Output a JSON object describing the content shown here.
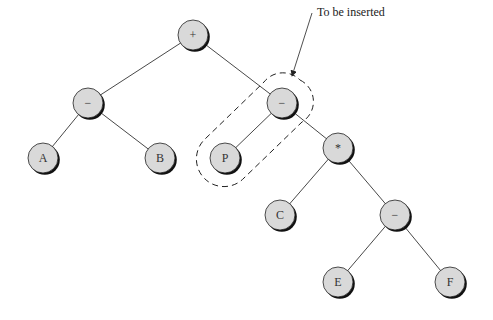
{
  "diagram": {
    "type": "expression-tree",
    "annotation": {
      "text": "To be inserted",
      "x": 315,
      "y": 14
    },
    "node_style": {
      "fill": "#d9d9d9",
      "stroke": "#222222",
      "shadow": "#111111",
      "radius": 15
    },
    "nodes": [
      {
        "id": "plus",
        "label": "+",
        "x": 193,
        "y": 35
      },
      {
        "id": "minus1",
        "label": "−",
        "x": 88,
        "y": 103
      },
      {
        "id": "minus2",
        "label": "−",
        "x": 282,
        "y": 103
      },
      {
        "id": "A",
        "label": "A",
        "x": 43,
        "y": 158
      },
      {
        "id": "B",
        "label": "B",
        "x": 160,
        "y": 158
      },
      {
        "id": "P",
        "label": "P",
        "x": 225,
        "y": 158
      },
      {
        "id": "times",
        "label": "*",
        "x": 338,
        "y": 148
      },
      {
        "id": "C",
        "label": "C",
        "x": 280,
        "y": 215
      },
      {
        "id": "minus3",
        "label": "−",
        "x": 395,
        "y": 215
      },
      {
        "id": "E",
        "label": "E",
        "x": 338,
        "y": 282
      },
      {
        "id": "F",
        "label": "F",
        "x": 450,
        "y": 282
      }
    ],
    "edges": [
      [
        "plus",
        "minus1"
      ],
      [
        "plus",
        "minus2"
      ],
      [
        "minus1",
        "A"
      ],
      [
        "minus1",
        "B"
      ],
      [
        "minus2",
        "P"
      ],
      [
        "minus2",
        "times"
      ],
      [
        "times",
        "C"
      ],
      [
        "times",
        "minus3"
      ],
      [
        "minus3",
        "E"
      ],
      [
        "minus3",
        "F"
      ]
    ],
    "highlight": {
      "label": "inserted-subtree",
      "nodes": [
        "minus2",
        "P"
      ]
    }
  }
}
